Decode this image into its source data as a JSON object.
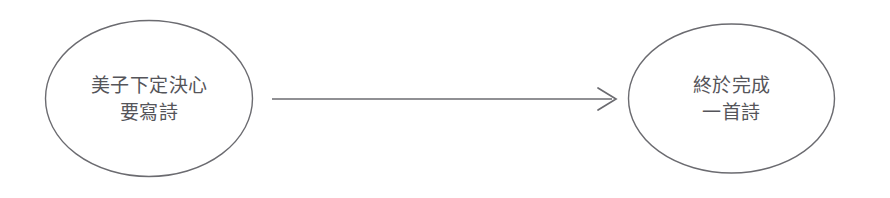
{
  "diagram": {
    "background_color": "#ffffff",
    "stroke_color": "#6b6b70",
    "text_color": "#55555a",
    "nodes": [
      {
        "id": "start",
        "shape": "ellipse",
        "line1": "美子下定決心",
        "line2": "要寫詩",
        "cx": 149,
        "cy": 98.5,
        "rx": 104,
        "ry": 78.5
      },
      {
        "id": "end",
        "shape": "ellipse",
        "line1": "終於完成",
        "line2": "一首詩",
        "cx": 731.5,
        "cy": 98.5,
        "rx": 103.5,
        "ry": 74.5
      }
    ],
    "edges": [
      {
        "id": "start-to-end",
        "from": "start",
        "to": "end",
        "label": "",
        "arrowhead": "open-chevron",
        "x1": 272,
        "x2": 616,
        "y": 99
      }
    ]
  }
}
